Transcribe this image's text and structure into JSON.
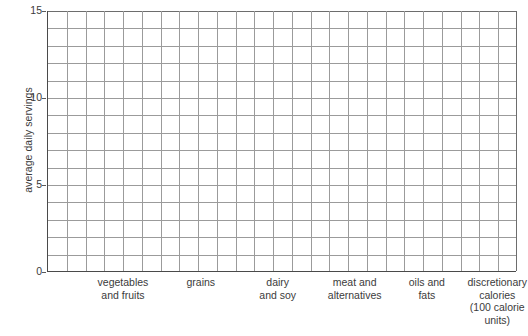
{
  "chart_data": {
    "type": "bar",
    "title": "",
    "subtitle": "",
    "xlabel": "",
    "ylabel": "average daily servings",
    "categories": [
      "vegetables and fruits",
      "grains",
      "dairy and soy",
      "meat and alternatives",
      "oils and fats",
      "discretionary calories (100 calorie units)"
    ],
    "values": [
      null,
      null,
      null,
      null,
      null,
      null
    ],
    "ylim": [
      0,
      15
    ],
    "ytick_labels": [
      "0",
      "5",
      "10",
      "15"
    ],
    "ytick_values": [
      0,
      5,
      10,
      15
    ],
    "y_minor_step": 1,
    "grid": true,
    "grid_columns": 25,
    "grid_rows": 15,
    "legend": "none",
    "note": "Blank grid — no data series plotted."
  },
  "axes": {
    "y_title": "average daily servings",
    "y_ticks": [
      {
        "label": "15",
        "value": 15
      },
      {
        "label": "10",
        "value": 10
      },
      {
        "label": "5",
        "value": 5
      },
      {
        "label": "0",
        "value": 0
      }
    ]
  },
  "x_categories": [
    {
      "lines": [
        "vegetables",
        "and fruits"
      ],
      "center_pct": 16.2
    },
    {
      "lines": [
        "grains"
      ],
      "center_pct": 32.8
    },
    {
      "lines": [
        "dairy",
        "and soy"
      ],
      "center_pct": 49.2
    },
    {
      "lines": [
        "meat and",
        "alternatives"
      ],
      "center_pct": 65.6
    },
    {
      "lines": [
        "oils and",
        "fats"
      ],
      "center_pct": 81.0
    },
    {
      "lines": [
        "discretionary",
        "calories",
        "(100 calorie",
        "units)"
      ],
      "center_pct": 96.0
    }
  ],
  "colors": {
    "grid": "#9b9b9b",
    "axis": "#4a4a4a",
    "text": "#3b3b3b",
    "background": "#ffffff"
  }
}
